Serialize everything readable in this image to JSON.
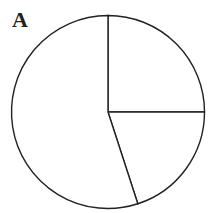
{
  "panel": {
    "label": "A"
  },
  "chart_data": {
    "type": "pie",
    "title": "",
    "categories": [
      "Slice 1",
      "Slice 2",
      "Slice 3"
    ],
    "values": [
      25,
      20,
      55
    ],
    "start_angle": "12 o'clock, clockwise",
    "fill": "#ffffff",
    "stroke": "#222222",
    "legend": "none",
    "labels": "none"
  }
}
